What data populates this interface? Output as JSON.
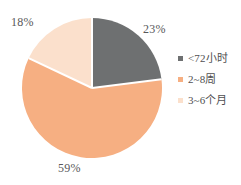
{
  "chart_data": {
    "type": "pie",
    "title": "",
    "subtitle": "",
    "xlabel": "",
    "ylabel": "",
    "grid": false,
    "legend_position": "right",
    "start_angle_deg": 0,
    "direction": "clockwise",
    "categories": [
      "<72小时",
      "2~8周",
      "3~6个月"
    ],
    "values": [
      23,
      59,
      18
    ],
    "value_unit": "%",
    "data_labels": [
      "23%",
      "59%",
      "18%"
    ],
    "colors": [
      "#6E7071",
      "#F6AF82",
      "#FBE0CC"
    ],
    "slices": [
      {
        "label": "<72小时",
        "value": 23,
        "data_label": "23%",
        "color": "#6E7071"
      },
      {
        "label": "2~8周",
        "value": 59,
        "data_label": "59%",
        "color": "#F6AF82"
      },
      {
        "label": "3~6个月",
        "value": 18,
        "data_label": "18%",
        "color": "#FBE0CC"
      }
    ]
  },
  "legend": {
    "entries": [
      {
        "label": "<72小时",
        "color": "#6E7071",
        "swatch_icon": "legend-square-icon"
      },
      {
        "label": "2~8周",
        "color": "#F6AF82",
        "swatch_icon": "legend-square-icon"
      },
      {
        "label": "3~6个月",
        "color": "#FBE0CC",
        "swatch_icon": "legend-square-icon"
      }
    ]
  },
  "style": {
    "background": "#ffffff",
    "slice_separator": "#ffffff",
    "label_color": "#58585a"
  }
}
